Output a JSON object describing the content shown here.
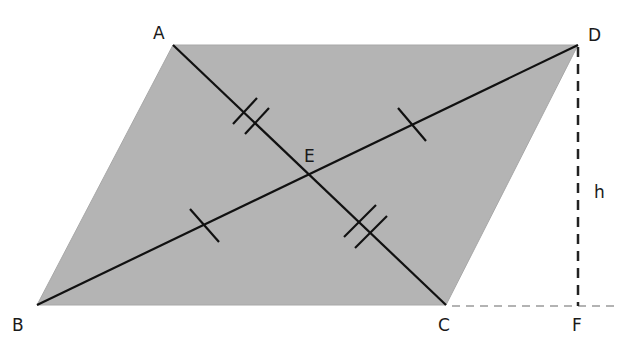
{
  "diagram": {
    "colors": {
      "fill": "#b4b4b4",
      "stroke": "#111111",
      "dashed_height": "#222222",
      "dashed_extension": "#9a9a9a",
      "label": "#1a1a1a"
    },
    "points": {
      "A": {
        "label": "A",
        "x": 173,
        "y": 45
      },
      "B": {
        "label": "B",
        "x": 37,
        "y": 305
      },
      "C": {
        "label": "C",
        "x": 446,
        "y": 305
      },
      "D": {
        "label": "D",
        "x": 578,
        "y": 45
      },
      "E": {
        "label": "E",
        "x": 310,
        "y": 175
      },
      "F": {
        "label": "F",
        "x": 578,
        "y": 305
      }
    },
    "labels": {
      "A": "A",
      "B": "B",
      "C": "C",
      "D": "D",
      "E": "E",
      "F": "F",
      "h": "h"
    },
    "segments": [
      {
        "name": "diagonal-AC",
        "from": "A",
        "to": "C",
        "style": "solid",
        "tick_marks": 2
      },
      {
        "name": "diagonal-BD",
        "from": "B",
        "to": "D",
        "style": "solid",
        "tick_marks": 1
      },
      {
        "name": "height-DF",
        "from": "D",
        "to": "F",
        "style": "dashed",
        "label": "h"
      },
      {
        "name": "extension-CF",
        "from": "C",
        "to": "F",
        "style": "dashed"
      }
    ],
    "congruence_marks": {
      "AE_CE": "double tick",
      "BE_DE": "single tick"
    }
  }
}
